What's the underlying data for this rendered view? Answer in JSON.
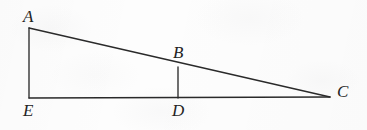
{
  "figure": {
    "caption": "",
    "background_color": "#fdfdfd",
    "stroke_color": "#2a2a2a",
    "label_color": "#232323",
    "width": 367,
    "height": 130
  },
  "chart_data": {
    "type": "diagram",
    "title": "",
    "points": [
      {
        "id": "A",
        "label": "A",
        "x": 29,
        "y": 28
      },
      {
        "id": "B",
        "label": "B",
        "x": 178,
        "y": 67
      },
      {
        "id": "C",
        "label": "C",
        "x": 330,
        "y": 97
      },
      {
        "id": "D",
        "label": "D",
        "x": 178,
        "y": 98
      },
      {
        "id": "E",
        "label": "E",
        "x": 29,
        "y": 98
      }
    ],
    "segments": [
      {
        "id": "AC",
        "from": "A",
        "to": "C",
        "name": "hypotenuse-ac"
      },
      {
        "id": "AE",
        "from": "A",
        "to": "E",
        "name": "vertical-ae"
      },
      {
        "id": "EC",
        "from": "E",
        "to": "C",
        "name": "base-ec"
      },
      {
        "id": "BD",
        "from": "B",
        "to": "D",
        "name": "vertical-bd"
      }
    ],
    "labels": [
      {
        "id": "A",
        "text": "A",
        "left": 23,
        "top": 8,
        "anchor": "above-left-of-A"
      },
      {
        "id": "B",
        "text": "B",
        "left": 173,
        "top": 44,
        "anchor": "above-B"
      },
      {
        "id": "C",
        "text": "C",
        "left": 337,
        "top": 83,
        "anchor": "right-of-C"
      },
      {
        "id": "D",
        "text": "D",
        "left": 172,
        "top": 102,
        "anchor": "below-D"
      },
      {
        "id": "E",
        "text": "E",
        "left": 23,
        "top": 102,
        "anchor": "below-E"
      }
    ],
    "grid": false,
    "legend": null
  }
}
